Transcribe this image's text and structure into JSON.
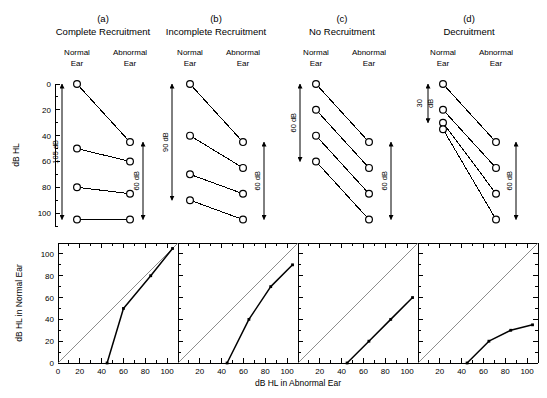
{
  "figure": {
    "axis_label_top_y": "dB HL",
    "axis_label_bottom_y": "dB HL in Normal Ear",
    "axis_label_bottom_x": "dB HL in Abnormal Ear",
    "column_header_normal": "Normal\nEar",
    "column_header_normal_line1": "Normal",
    "column_header_normal_line2": "Ear",
    "column_header_abnormal_line1": "Abnormal",
    "column_header_abnormal_line2": "Ear",
    "stroke_color": "#000000",
    "diagonal_color": "#808080"
  },
  "chart_data": [
    {
      "id": "a-top",
      "type": "line",
      "panel_letter": "(a)",
      "title": "Complete Recruitment",
      "ylabel": "dB HL",
      "ylim": [
        0,
        110
      ],
      "y_inverted": true,
      "yticks": [
        0,
        20,
        40,
        60,
        80,
        100
      ],
      "yticks_minor_step": 10,
      "categories": [
        "Normal Ear",
        "Abnormal Ear"
      ],
      "pairs": [
        {
          "normal": 0,
          "abnormal": 45
        },
        {
          "normal": 50,
          "abnormal": 60
        },
        {
          "normal": 80,
          "abnormal": 85
        },
        {
          "normal": 105,
          "abnormal": 105
        }
      ],
      "annotations": [
        {
          "name": "left-range-arrow",
          "text": "105 dB",
          "from": 0,
          "to": 105,
          "side": "normal"
        },
        {
          "name": "right-range-arrow",
          "text": "60 dB",
          "from": 45,
          "to": 105,
          "side": "abnormal"
        }
      ]
    },
    {
      "id": "b-top",
      "type": "line",
      "panel_letter": "(b)",
      "title": "Incomplete Recruitment",
      "ylim": [
        0,
        110
      ],
      "y_inverted": true,
      "categories": [
        "Normal Ear",
        "Abnormal Ear"
      ],
      "pairs": [
        {
          "normal": 0,
          "abnormal": 45
        },
        {
          "normal": 40,
          "abnormal": 65
        },
        {
          "normal": 70,
          "abnormal": 85
        },
        {
          "normal": 90,
          "abnormal": 105
        }
      ],
      "annotations": [
        {
          "name": "left-range-arrow",
          "text": "90 dB",
          "from": 0,
          "to": 90,
          "side": "normal"
        },
        {
          "name": "right-range-arrow",
          "text": "60 dB",
          "from": 45,
          "to": 105,
          "side": "abnormal"
        }
      ]
    },
    {
      "id": "c-top",
      "type": "line",
      "panel_letter": "(c)",
      "title": "No Recruitment",
      "ylim": [
        0,
        110
      ],
      "y_inverted": true,
      "categories": [
        "Normal Ear",
        "Abnormal Ear"
      ],
      "pairs": [
        {
          "normal": 0,
          "abnormal": 45
        },
        {
          "normal": 20,
          "abnormal": 65
        },
        {
          "normal": 40,
          "abnormal": 85
        },
        {
          "normal": 60,
          "abnormal": 105
        }
      ],
      "annotations": [
        {
          "name": "left-range-arrow",
          "text": "60 dB",
          "from": 0,
          "to": 60,
          "side": "normal"
        },
        {
          "name": "right-range-arrow",
          "text": "60 dB",
          "from": 45,
          "to": 105,
          "side": "abnormal"
        }
      ]
    },
    {
      "id": "d-top",
      "type": "line",
      "panel_letter": "(d)",
      "title": "Decruitment",
      "ylim": [
        0,
        110
      ],
      "y_inverted": true,
      "categories": [
        "Normal Ear",
        "Abnormal Ear"
      ],
      "pairs": [
        {
          "normal": 0,
          "abnormal": 45
        },
        {
          "normal": 20,
          "abnormal": 65
        },
        {
          "normal": 30,
          "abnormal": 85
        },
        {
          "normal": 35,
          "abnormal": 105
        }
      ],
      "annotations": [
        {
          "name": "left-range-arrow",
          "text": "30\ndB",
          "text_line1": "30",
          "text_line2": "dB",
          "from": 0,
          "to": 30,
          "side": "normal"
        },
        {
          "name": "right-range-arrow",
          "text": "60 dB",
          "from": 45,
          "to": 105,
          "side": "abnormal"
        }
      ]
    },
    {
      "id": "a-bottom",
      "type": "line",
      "xlabel": "dB HL in Abnormal Ear",
      "ylabel": "dB HL in Normal Ear",
      "xlim": [
        0,
        110
      ],
      "ylim": [
        0,
        110
      ],
      "xticks": [
        0,
        20,
        40,
        60,
        80,
        100
      ],
      "yticks": [
        0,
        20,
        40,
        60,
        80,
        100
      ],
      "grid": false,
      "reference_line": {
        "name": "unity-diagonal",
        "from": [
          0,
          0
        ],
        "to": [
          110,
          110
        ]
      },
      "x": [
        45,
        60,
        85,
        105
      ],
      "y": [
        0,
        50,
        80,
        105
      ]
    },
    {
      "id": "b-bottom",
      "type": "line",
      "xlim": [
        0,
        110
      ],
      "ylim": [
        0,
        110
      ],
      "xticks": [
        0,
        20,
        40,
        60,
        80,
        100
      ],
      "grid": false,
      "reference_line": {
        "name": "unity-diagonal",
        "from": [
          0,
          0
        ],
        "to": [
          110,
          110
        ]
      },
      "x": [
        45,
        65,
        85,
        105
      ],
      "y": [
        0,
        40,
        70,
        90
      ]
    },
    {
      "id": "c-bottom",
      "type": "line",
      "xlim": [
        0,
        110
      ],
      "ylim": [
        0,
        110
      ],
      "xticks": [
        0,
        20,
        40,
        60,
        80,
        100
      ],
      "grid": false,
      "reference_line": {
        "name": "unity-diagonal",
        "from": [
          0,
          0
        ],
        "to": [
          110,
          110
        ]
      },
      "x": [
        45,
        65,
        85,
        105
      ],
      "y": [
        0,
        20,
        40,
        60
      ]
    },
    {
      "id": "d-bottom",
      "type": "line",
      "xlim": [
        0,
        110
      ],
      "ylim": [
        0,
        110
      ],
      "xticks": [
        0,
        20,
        40,
        60,
        80,
        100
      ],
      "grid": false,
      "reference_line": {
        "name": "unity-diagonal",
        "from": [
          0,
          0
        ],
        "to": [
          110,
          110
        ]
      },
      "x": [
        45,
        65,
        85,
        105
      ],
      "y": [
        0,
        20,
        30,
        35
      ]
    }
  ]
}
